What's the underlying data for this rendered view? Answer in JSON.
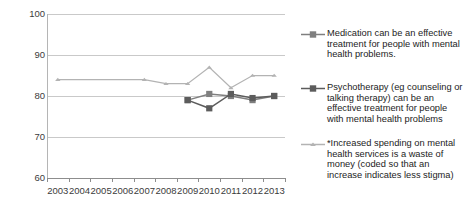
{
  "chart_data": {
    "type": "line",
    "title": "",
    "xlabel": "",
    "ylabel": "",
    "ylim": [
      60,
      100
    ],
    "yticks": [
      60,
      70,
      80,
      90,
      100
    ],
    "grid": true,
    "legend_position": "right",
    "categories": [
      "2003",
      "2004",
      "2005",
      "2006",
      "2007",
      "2008",
      "2009",
      "2010",
      "2011",
      "2012",
      "2013"
    ],
    "series": [
      {
        "name": "Medication can be an effective treatment for people with mental health problems.",
        "color": "#7f7f7f",
        "marker": "square",
        "values": [
          null,
          null,
          null,
          null,
          null,
          null,
          79,
          80.5,
          80,
          79,
          80
        ]
      },
      {
        "name": "Psychotherapy (eg counseling or talking therapy) can be an effective treatment for people with mental health problems",
        "color": "#5c5c5c",
        "marker": "square",
        "values": [
          null,
          null,
          null,
          null,
          null,
          null,
          79,
          77,
          80.5,
          79.5,
          80
        ]
      },
      {
        "name": "*Increased spending on mental health services is a waste of money  (coded so that an increase indicates less stigma)",
        "color": "#b3b3b3",
        "marker": "triangle",
        "values": [
          84,
          null,
          null,
          null,
          84,
          83,
          83,
          87,
          82,
          85,
          85
        ]
      }
    ]
  },
  "axis": {
    "y_labels": [
      "100",
      "90",
      "80",
      "70",
      "60"
    ],
    "x_labels": [
      "2003",
      "2004",
      "2005",
      "2006",
      "2007",
      "2008",
      "2009",
      "2010",
      "2011",
      "2012",
      "2013"
    ]
  },
  "legend": {
    "entries": [
      {
        "label": "Medication can be an effective treatment for people with mental health problems.",
        "color": "#7f7f7f",
        "marker": "square"
      },
      {
        "label": "Psychotherapy (eg counseling or talking therapy) can be an effective treatment for people with mental health problems",
        "color": "#5c5c5c",
        "marker": "square"
      },
      {
        "label": "*Increased spending on mental health services is a waste of money  (coded so that an increase indicates less stigma)",
        "color": "#b3b3b3",
        "marker": "triangle"
      }
    ]
  }
}
